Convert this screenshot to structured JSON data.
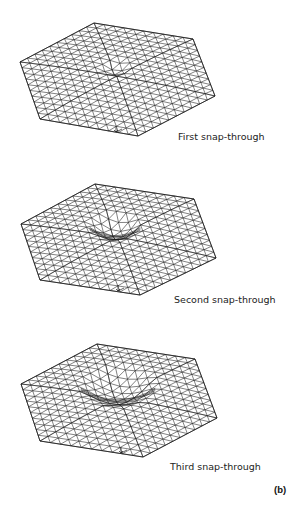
{
  "figure": {
    "label": "(b)",
    "line_color": "#1a1a1a",
    "background": "#ffffff",
    "mesh_subdivisions": 10,
    "panels": [
      {
        "caption": "First snap-through",
        "caption_pos": [
          178,
          131
        ],
        "hex_vertices": [
          [
            20,
            62
          ],
          [
            94,
            23
          ],
          [
            193,
            39
          ],
          [
            215,
            96
          ],
          [
            138,
            136
          ],
          [
            40,
            119
          ]
        ],
        "dimple": {
          "center": [
            115,
            70
          ],
          "radius": 0.16,
          "depth": 6,
          "rim": false
        }
      },
      {
        "caption": "Second snap-through",
        "caption_pos": [
          174,
          294
        ],
        "hex_vertices": [
          [
            21,
            224
          ],
          [
            95,
            184
          ],
          [
            194,
            199
          ],
          [
            216,
            258
          ],
          [
            140,
            295
          ],
          [
            40,
            280
          ]
        ],
        "dimple": {
          "center": [
            115,
            228
          ],
          "radius": 0.26,
          "depth": 12,
          "rim": true
        }
      },
      {
        "caption": "Third snap-through",
        "caption_pos": [
          170,
          461
        ],
        "hex_vertices": [
          [
            21,
            384
          ],
          [
            97,
            344
          ],
          [
            195,
            359
          ],
          [
            217,
            418
          ],
          [
            143,
            457
          ],
          [
            40,
            441
          ]
        ],
        "dimple": {
          "center": [
            118,
            388
          ],
          "radius": 0.38,
          "depth": 13,
          "rim": true
        }
      }
    ]
  }
}
